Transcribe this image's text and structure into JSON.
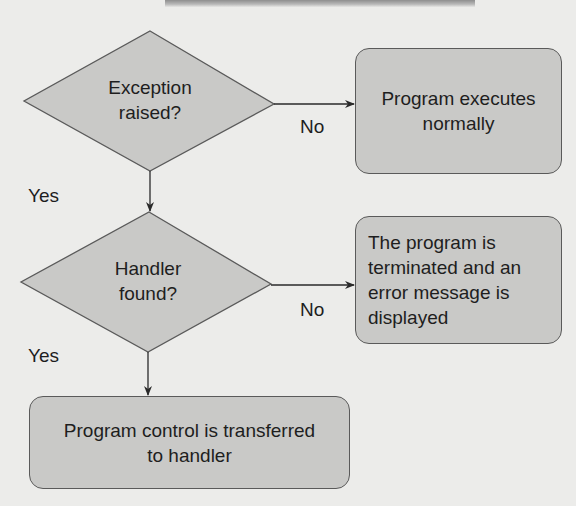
{
  "diagram": {
    "type": "flowchart",
    "colors": {
      "background": "#ececea",
      "node_fill": "#c9c9c7",
      "node_border": "#5a5a5a",
      "text": "#1e1e1e",
      "arrow": "#2a2a2a"
    },
    "nodes": {
      "decision_exception": {
        "shape": "diamond",
        "text": "Exception\nraised?"
      },
      "process_normal": {
        "shape": "rounded-rect",
        "text": "Program executes\nnormally"
      },
      "decision_handler": {
        "shape": "diamond",
        "text": "Handler\nfound?"
      },
      "process_terminated": {
        "shape": "rounded-rect",
        "text": "The program is\nterminated and an\nerror message is\ndisplayed"
      },
      "process_transfer": {
        "shape": "rounded-rect",
        "text": "Program control is transferred\nto handler"
      }
    },
    "edges": [
      {
        "from": "decision_exception",
        "to": "process_normal",
        "label": "No"
      },
      {
        "from": "decision_exception",
        "to": "decision_handler",
        "label": "Yes"
      },
      {
        "from": "decision_handler",
        "to": "process_terminated",
        "label": "No"
      },
      {
        "from": "decision_handler",
        "to": "process_transfer",
        "label": "Yes"
      }
    ],
    "labels": {
      "no_1": "No",
      "yes_1": "Yes",
      "no_2": "No",
      "yes_2": "Yes"
    }
  }
}
